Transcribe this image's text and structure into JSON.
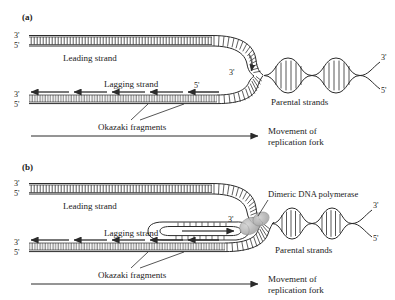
{
  "figure": {
    "background_color": "#ffffff",
    "ink_color": "#1a1a1a",
    "polymerase_fill": "#b9b9b9"
  },
  "panels": [
    {
      "tag": "(a)",
      "labels": {
        "leading_strand": "Leading strand",
        "lagging_strand": "Lagging strand",
        "parental_strands": "Parental strands",
        "okazaki_fragments": "Okazaki fragments",
        "movement_line1": "Movement of",
        "movement_line2": "replication fork"
      },
      "end_labels": {
        "leading_top_3": "3'",
        "leading_top_5": "5'",
        "lagging_left_3": "3'",
        "lagging_left_5": "5'",
        "fork_leading_3": "3'",
        "fork_lagging_5": "5'",
        "parental_right_3": "3'",
        "parental_right_5": "5'"
      },
      "okazaki_fragment_count": 5,
      "parental_helix_turns": 4
    },
    {
      "tag": "(b)",
      "labels": {
        "leading_strand": "Leading strand",
        "lagging_strand": "Lagging strand",
        "parental_strands": "Parental strands",
        "okazaki_fragments": "Okazaki fragments",
        "dimeric_polymerase": "Dimeric DNA polymerase",
        "movement_line1": "Movement of",
        "movement_line2": "replication fork"
      },
      "end_labels": {
        "leading_top_3": "3'",
        "leading_top_5": "5'",
        "lagging_left_3": "3'",
        "lagging_left_5": "5'",
        "fork_leading_3": "3'",
        "parental_right_3": "3'",
        "parental_right_5": "5'"
      },
      "okazaki_fragment_count": 5,
      "parental_helix_turns": 4,
      "has_trombone_loop": true
    }
  ]
}
